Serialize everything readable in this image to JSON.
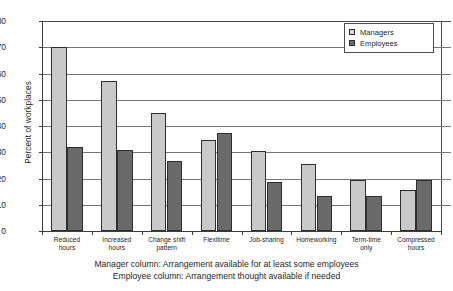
{
  "chart_data": {
    "type": "bar",
    "title": "",
    "xlabel": "",
    "ylabel": "Percent of workplaces",
    "ylim": [
      0,
      80
    ],
    "ytick_step": 10,
    "yticks": [
      0,
      10,
      20,
      30,
      40,
      50,
      60,
      70,
      80
    ],
    "grid": true,
    "legend_position": "top-right",
    "categories": [
      "Reduced hours",
      "Increased hours",
      "Change shift pattern",
      "Flexitime",
      "Job-sharing",
      "Homeworking",
      "Term-time only",
      "Compressed hours"
    ],
    "category_lines": [
      [
        "Reduced",
        "hours"
      ],
      [
        "Increased",
        "hours"
      ],
      [
        "Change shift",
        "pattern"
      ],
      [
        "Flexitime",
        ""
      ],
      [
        "Job-sharing",
        ""
      ],
      [
        "Homeworking",
        ""
      ],
      [
        "Term-time",
        "only"
      ],
      [
        "Compressed",
        "hours"
      ]
    ],
    "series": [
      {
        "name": "Managers",
        "color": "#c9c9c9",
        "values": [
          70,
          57,
          45,
          34.5,
          30.5,
          25.5,
          19.5,
          15.5
        ]
      },
      {
        "name": "Employees",
        "color": "#6a6a6a",
        "values": [
          32,
          31,
          26.5,
          37.5,
          18.5,
          13.5,
          13.5,
          19.5
        ]
      }
    ],
    "annotations": [
      "Manager column: Arrangement available for at least some employees",
      "Employee column: Arrangement thought available if needed"
    ]
  },
  "legend": {
    "items": [
      {
        "label": "Managers",
        "swatch": "managers"
      },
      {
        "label": "Employees",
        "swatch": "employees"
      }
    ]
  },
  "axis": {
    "y_title": "Percent of workplaces",
    "y_tick_labels": [
      "80",
      "70",
      "60",
      "50",
      "40",
      "30",
      "20",
      "10",
      "0"
    ]
  },
  "caption": {
    "line1": "Manager column: Arrangement available for at least some employees",
    "line2": "Employee column: Arrangement thought available if needed"
  }
}
